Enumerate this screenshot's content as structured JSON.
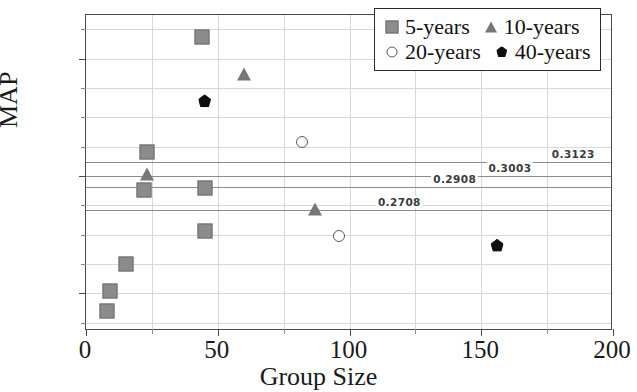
{
  "chart_data": {
    "type": "scatter",
    "title": "",
    "xlabel": "Group Size",
    "ylabel": "MAP",
    "xlim": [
      0,
      200
    ],
    "ylim": [
      0.168,
      0.437
    ],
    "grid": true,
    "legend_position": "top-right",
    "xticks": [
      "0",
      "50",
      "100",
      "150",
      "200"
    ],
    "xtick_values": [
      0,
      50,
      100,
      150,
      200
    ],
    "yticks": [
      "0.2",
      "0.3",
      "0.4"
    ],
    "ytick_values": [
      0.2,
      0.3,
      0.4
    ],
    "series": [
      {
        "name": "5-years",
        "marker": "square",
        "color": "#8b8b8b",
        "points": [
          {
            "x": 8,
            "y": 0.185
          },
          {
            "x": 9,
            "y": 0.202
          },
          {
            "x": 15,
            "y": 0.225
          },
          {
            "x": 22,
            "y": 0.288
          },
          {
            "x": 23,
            "y": 0.32
          },
          {
            "x": 44,
            "y": 0.418
          },
          {
            "x": 45,
            "y": 0.29
          },
          {
            "x": 45,
            "y": 0.253
          }
        ]
      },
      {
        "name": "10-years",
        "marker": "triangle",
        "color": "#777777",
        "points": [
          {
            "x": 23,
            "y": 0.302
          },
          {
            "x": 60,
            "y": 0.387
          },
          {
            "x": 87,
            "y": 0.272
          }
        ]
      },
      {
        "name": "20-years",
        "marker": "open-circle",
        "color": "#5a5a5a",
        "points": [
          {
            "x": 82,
            "y": 0.329
          },
          {
            "x": 96,
            "y": 0.249
          }
        ]
      },
      {
        "name": "40-years",
        "marker": "pentagon",
        "color": "#101010",
        "points": [
          {
            "x": 45,
            "y": 0.364
          },
          {
            "x": 156,
            "y": 0.241
          }
        ]
      }
    ],
    "reference_lines": [
      {
        "value": 0.3123,
        "label": "0.3123",
        "label_x": 176
      },
      {
        "value": 0.3003,
        "label": "0.3003",
        "label_x": 152
      },
      {
        "value": 0.2908,
        "label": "0.2908",
        "label_x": 131
      },
      {
        "value": 0.2708,
        "label": "0.2708",
        "label_x": 110
      }
    ],
    "gridlines_x": [
      25,
      50,
      75,
      100,
      125,
      150,
      175
    ],
    "gridlines_y": [
      0.175,
      0.2,
      0.225,
      0.25,
      0.275,
      0.3,
      0.325,
      0.35,
      0.375,
      0.4,
      0.425
    ]
  },
  "legend": {
    "rows": [
      [
        {
          "label": "5-years",
          "marker": "square"
        },
        {
          "label": "10-years",
          "marker": "triangle"
        }
      ],
      [
        {
          "label": "20-years",
          "marker": "open-circle"
        },
        {
          "label": "40-years",
          "marker": "pentagon"
        }
      ]
    ]
  }
}
